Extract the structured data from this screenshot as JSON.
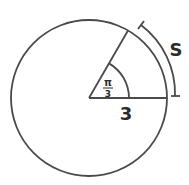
{
  "diagram": {
    "type": "circle-arc-length",
    "colors": {
      "stroke": "#4a4a4a",
      "text": "#2b2b2b",
      "background": "#ffffff"
    },
    "labels": {
      "angle_numerator": "π",
      "angle_denominator": "3",
      "radius": "3",
      "arc": "S"
    }
  }
}
